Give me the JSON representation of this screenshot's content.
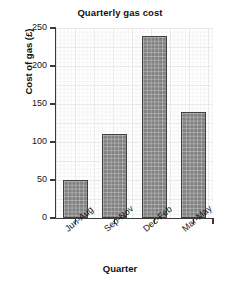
{
  "chart_data": {
    "type": "bar",
    "title": "Quarterly gas cost",
    "xlabel": "Quarter",
    "ylabel": "Cost of gas (£)",
    "categories": [
      "Jun-Aug",
      "Sep-Nov",
      "Dec-Feb",
      "Mar-May"
    ],
    "values": [
      50,
      110,
      240,
      140
    ],
    "ylim": [
      0,
      250
    ],
    "yticks": [
      0,
      50,
      100,
      150,
      200,
      250
    ],
    "ytick_labels": [
      "0",
      "50",
      "100",
      "150",
      "200",
      "250"
    ],
    "grid": true,
    "legend": false,
    "bar_color": "#808080",
    "bar_edge_color": "#3f3f3f",
    "grid_color": "#e9e9e9",
    "axis_color": "#3a3a3a"
  }
}
